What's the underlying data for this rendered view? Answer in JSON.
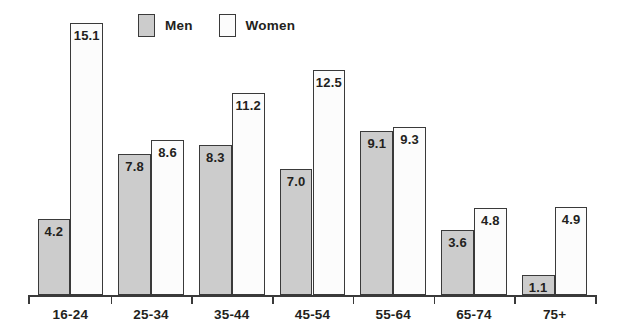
{
  "chart_data": {
    "type": "bar",
    "title": "",
    "subtitle": "",
    "xlabel": "",
    "ylabel": "",
    "categories": [
      "16-24",
      "25-34",
      "35-44",
      "45-54",
      "55-64",
      "65-74",
      "75+"
    ],
    "series": [
      {
        "name": "Men",
        "color": "#cccccc",
        "values": [
          4.2,
          7.8,
          8.3,
          7.0,
          9.1,
          3.6,
          1.1
        ],
        "labels": [
          "4.2",
          "7.8",
          "8.3",
          "7.0",
          "9.1",
          "3.6",
          "1.1"
        ]
      },
      {
        "name": "Women",
        "color": "#fcfcfc",
        "values": [
          15.1,
          8.6,
          11.2,
          12.5,
          9.3,
          4.8,
          4.9
        ],
        "labels": [
          "15.1",
          "8.6",
          "11.2",
          "12.5",
          "9.3",
          "4.8",
          "4.9"
        ]
      }
    ],
    "ylim": [
      0,
      15.8
    ],
    "grid": false,
    "legend_position": "top-left",
    "axis": {
      "show_y_axis": false,
      "show_x_axis": true,
      "tick_count": 8
    }
  },
  "legend": {
    "entries": [
      {
        "label": "Men",
        "swatch": "men-swatch"
      },
      {
        "label": "Women",
        "swatch": "women-swatch"
      }
    ]
  },
  "colors": {
    "men_fill": "#cccccc",
    "women_fill": "#fcfcfc",
    "outline": "#3a3a3a",
    "text": "#231f20",
    "background": "#ffffff"
  }
}
